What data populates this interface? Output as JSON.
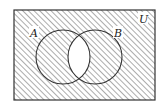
{
  "diagram": {
    "type": "venn",
    "universe_label": "U",
    "sets": [
      {
        "label": "A",
        "cx": 63,
        "cy": 57,
        "r": 27
      },
      {
        "label": "B",
        "cx": 95,
        "cy": 57,
        "r": 27
      }
    ],
    "shaded_region": "(A ∩ B)'",
    "colors": {
      "line": "#333333",
      "hatch": "#555555",
      "background": "#ffffff"
    }
  }
}
